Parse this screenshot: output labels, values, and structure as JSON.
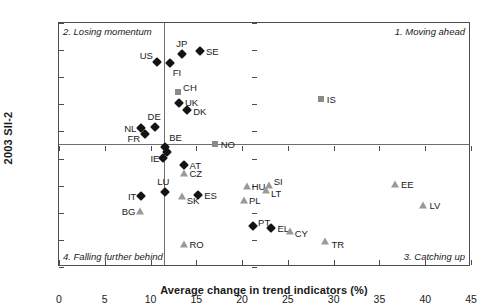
{
  "chart_data": {
    "type": "scatter",
    "title": "",
    "xlabel": "Average change in trend indicators (%)",
    "ylabel": "2003 SII-2",
    "xlim": [
      0,
      45
    ],
    "ylim": [
      0.0,
      0.9
    ],
    "xticks": [
      "0",
      "5",
      "10",
      "15",
      "20",
      "25",
      "30",
      "35",
      "40",
      "45"
    ],
    "yticks": [
      "0.0",
      "0.1",
      "0.2",
      "0.3",
      "0.4",
      "0.5",
      "0.6",
      "0.7",
      "0.8",
      "0.9"
    ],
    "grid": false,
    "legend": null,
    "reference_lines": {
      "vertical_x": 11.5,
      "horizontal_y": 0.455
    },
    "quadrant_labels": [
      {
        "key": "top_left",
        "text": "2. Losing momentum"
      },
      {
        "key": "top_right",
        "text": "1. Moving ahead"
      },
      {
        "key": "bottom_left",
        "text": "4. Falling further behind"
      },
      {
        "key": "bottom_right",
        "text": "3. Catching up"
      }
    ],
    "marker_colors": {
      "diamond": "#141414",
      "square": "#8a8a8a",
      "triangle": "#9a9a9a"
    },
    "points": [
      {
        "label": "US",
        "x": 10.7,
        "y": 0.755,
        "marker": "diamond",
        "lpos": "l",
        "ldx": -4,
        "ldy": -7
      },
      {
        "label": "JP",
        "x": 13.4,
        "y": 0.785,
        "marker": "diamond",
        "lpos": "t",
        "ldx": 0,
        "ldy": -5
      },
      {
        "label": "SE",
        "x": 15.4,
        "y": 0.795,
        "marker": "diamond",
        "lpos": "r",
        "ldx": 6,
        "ldy": 0
      },
      {
        "label": "FI",
        "x": 12.1,
        "y": 0.752,
        "marker": "diamond",
        "lpos": "r",
        "ldx": 3,
        "ldy": 9
      },
      {
        "label": "CH",
        "x": 13.0,
        "y": 0.645,
        "marker": "square",
        "lpos": "r",
        "ldx": 5,
        "ldy": -5
      },
      {
        "label": "UK",
        "x": 13.1,
        "y": 0.605,
        "marker": "diamond",
        "lpos": "r",
        "ldx": 6,
        "ldy": -1
      },
      {
        "label": "DK",
        "x": 14.0,
        "y": 0.578,
        "marker": "diamond",
        "lpos": "r",
        "ldx": 6,
        "ldy": 1
      },
      {
        "label": "IS",
        "x": 28.6,
        "y": 0.62,
        "marker": "square",
        "lpos": "r",
        "ldx": 6,
        "ldy": 0
      },
      {
        "label": "DE",
        "x": 10.5,
        "y": 0.518,
        "marker": "diamond",
        "lpos": "t",
        "ldx": -1,
        "ldy": -5
      },
      {
        "label": "NL",
        "x": 9.0,
        "y": 0.513,
        "marker": "diamond",
        "lpos": "l",
        "ldx": -5,
        "ldy": 0
      },
      {
        "label": "FR",
        "x": 9.4,
        "y": 0.492,
        "marker": "diamond",
        "lpos": "l",
        "ldx": -5,
        "ldy": 4
      },
      {
        "label": "NO",
        "x": 17.0,
        "y": 0.455,
        "marker": "square",
        "lpos": "r",
        "ldx": 6,
        "ldy": 0
      },
      {
        "label": "BE",
        "x": 11.6,
        "y": 0.442,
        "marker": "diamond",
        "lpos": "r",
        "ldx": 4,
        "ldy": -10
      },
      {
        "label": "BE2",
        "x": 11.8,
        "y": 0.425,
        "marker": "diamond",
        "lpos": "none",
        "ldx": 0,
        "ldy": 0
      },
      {
        "label": "IE",
        "x": 11.4,
        "y": 0.402,
        "marker": "diamond",
        "lpos": "l",
        "ldx": -4,
        "ldy": 0
      },
      {
        "label": "AT",
        "x": 13.6,
        "y": 0.378,
        "marker": "diamond",
        "lpos": "r",
        "ldx": 6,
        "ldy": 0
      },
      {
        "label": "CZ",
        "x": 13.6,
        "y": 0.348,
        "marker": "triangle",
        "lpos": "r",
        "ldx": 6,
        "ldy": 0
      },
      {
        "label": "HU",
        "x": 20.5,
        "y": 0.3,
        "marker": "triangle",
        "lpos": "r",
        "ldx": 5,
        "ldy": 0
      },
      {
        "label": "SI",
        "x": 22.9,
        "y": 0.303,
        "marker": "triangle",
        "lpos": "r",
        "ldx": 5,
        "ldy": -4
      },
      {
        "label": "LT",
        "x": 22.6,
        "y": 0.285,
        "marker": "triangle",
        "lpos": "r",
        "ldx": 5,
        "ldy": 3
      },
      {
        "label": "EE",
        "x": 36.7,
        "y": 0.305,
        "marker": "triangle",
        "lpos": "r",
        "ldx": 6,
        "ldy": 0
      },
      {
        "label": "LU",
        "x": 11.6,
        "y": 0.275,
        "marker": "diamond",
        "lpos": "t",
        "ldx": -2,
        "ldy": -5
      },
      {
        "label": "IT",
        "x": 9.0,
        "y": 0.262,
        "marker": "diamond",
        "lpos": "l",
        "ldx": -5,
        "ldy": 0
      },
      {
        "label": "SK",
        "x": 13.4,
        "y": 0.262,
        "marker": "triangle",
        "lpos": "r",
        "ldx": 5,
        "ldy": 4
      },
      {
        "label": "ES",
        "x": 15.2,
        "y": 0.265,
        "marker": "diamond",
        "lpos": "r",
        "ldx": 6,
        "ldy": 0
      },
      {
        "label": "PL",
        "x": 20.2,
        "y": 0.248,
        "marker": "triangle",
        "lpos": "r",
        "ldx": 5,
        "ldy": 0
      },
      {
        "label": "LV",
        "x": 39.8,
        "y": 0.228,
        "marker": "triangle",
        "lpos": "r",
        "ldx": 6,
        "ldy": 0
      },
      {
        "label": "BG",
        "x": 8.9,
        "y": 0.205,
        "marker": "triangle",
        "lpos": "l",
        "ldx": -5,
        "ldy": 0
      },
      {
        "label": "PT",
        "x": 21.2,
        "y": 0.152,
        "marker": "diamond",
        "lpos": "r",
        "ldx": 5,
        "ldy": -4
      },
      {
        "label": "EL",
        "x": 23.2,
        "y": 0.145,
        "marker": "diamond",
        "lpos": "r",
        "ldx": 6,
        "ldy": 0
      },
      {
        "label": "CY",
        "x": 25.2,
        "y": 0.132,
        "marker": "triangle",
        "lpos": "r",
        "ldx": 5,
        "ldy": 2
      },
      {
        "label": "RO",
        "x": 13.6,
        "y": 0.085,
        "marker": "triangle",
        "lpos": "r",
        "ldx": 6,
        "ldy": 0
      },
      {
        "label": "TR",
        "x": 29.1,
        "y": 0.095,
        "marker": "triangle",
        "lpos": "r",
        "ldx": 6,
        "ldy": 3
      }
    ]
  }
}
